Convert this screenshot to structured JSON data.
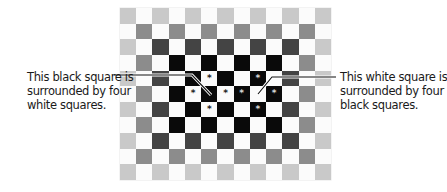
{
  "figure": {
    "grid": {
      "columns": 13,
      "rows": 11,
      "legend": {
        "W": "white",
        "L": "light gray",
        "M": "medium gray",
        "D": "dark gray",
        "K": "black"
      },
      "colors": {
        "W": "#fbfbfb",
        "L": "#c9c9c9",
        "M": "#8c8c8c",
        "D": "#444444",
        "K": "#0a0a0a"
      },
      "cells": [
        [
          "L",
          "W",
          "L",
          "W",
          "L",
          "W",
          "L",
          "W",
          "L",
          "W",
          "L",
          "W",
          "L"
        ],
        [
          "W",
          "M",
          "W",
          "M",
          "W",
          "M",
          "W",
          "M",
          "W",
          "M",
          "W",
          "M",
          "W"
        ],
        [
          "L",
          "W",
          "D",
          "W",
          "D",
          "W",
          "D",
          "W",
          "D",
          "W",
          "D",
          "W",
          "L"
        ],
        [
          "W",
          "M",
          "W",
          "K",
          "W",
          "K",
          "W",
          "K",
          "W",
          "K",
          "W",
          "M",
          "W"
        ],
        [
          "L",
          "W",
          "D",
          "W",
          "K",
          "W",
          "K",
          "W",
          "K",
          "W",
          "D",
          "W",
          "L"
        ],
        [
          "W",
          "M",
          "W",
          "K",
          "W",
          "K",
          "W",
          "K",
          "W",
          "K",
          "W",
          "M",
          "W"
        ],
        [
          "L",
          "W",
          "D",
          "W",
          "K",
          "W",
          "K",
          "W",
          "K",
          "W",
          "D",
          "W",
          "L"
        ],
        [
          "W",
          "M",
          "W",
          "K",
          "W",
          "K",
          "W",
          "K",
          "W",
          "K",
          "W",
          "M",
          "W"
        ],
        [
          "L",
          "W",
          "D",
          "W",
          "D",
          "W",
          "D",
          "W",
          "D",
          "W",
          "D",
          "W",
          "L"
        ],
        [
          "W",
          "M",
          "W",
          "M",
          "W",
          "M",
          "W",
          "M",
          "W",
          "M",
          "W",
          "M",
          "W"
        ],
        [
          "L",
          "W",
          "L",
          "W",
          "L",
          "W",
          "L",
          "W",
          "L",
          "W",
          "L",
          "W",
          "L"
        ]
      ],
      "markers": [
        {
          "row": 4,
          "col": 5,
          "symbol": "*"
        },
        {
          "row": 5,
          "col": 4,
          "symbol": "*"
        },
        {
          "row": 5,
          "col": 6,
          "symbol": "*"
        },
        {
          "row": 6,
          "col": 5,
          "symbol": "*"
        },
        {
          "row": 4,
          "col": 8,
          "symbol": "*"
        },
        {
          "row": 5,
          "col": 7,
          "symbol": "*"
        },
        {
          "row": 5,
          "col": 9,
          "symbol": "*"
        },
        {
          "row": 6,
          "col": 8,
          "symbol": "*"
        }
      ]
    },
    "captions": {
      "left": {
        "lines": [
          "This black square is",
          "surrounded by four",
          "white squares."
        ],
        "target": {
          "row": 5,
          "col": 5,
          "color": "black"
        }
      },
      "right": {
        "lines": [
          "This white square is",
          "surrounded by four",
          "black squares."
        ],
        "target": {
          "row": 5,
          "col": 8,
          "color": "white"
        }
      }
    }
  }
}
